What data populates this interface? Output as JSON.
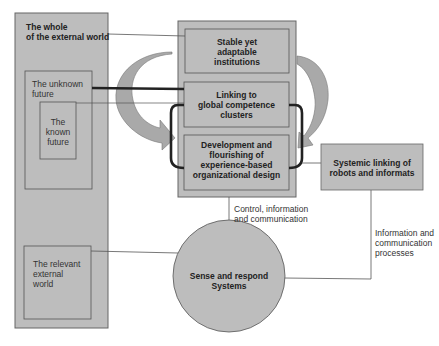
{
  "diagram": {
    "external_world": {
      "label_line1": "The whole",
      "label_line2": "of the external world"
    },
    "unknown_future": {
      "label_line1": "The unknown",
      "label_line2": "future"
    },
    "known_future": {
      "label_line1": "The",
      "label_line2": "known",
      "label_line3": "future"
    },
    "relevant_world": {
      "label_line1": "The relevant",
      "label_line2": "external",
      "label_line3": "world"
    },
    "stable_institutions": {
      "label_line1": "Stable yet",
      "label_line2": "adaptable",
      "label_line3": "institutions"
    },
    "linking_clusters": {
      "label_line1": "Linking to",
      "label_line2": "global competence",
      "label_line3": "clusters"
    },
    "development": {
      "label_line1": "Development and",
      "label_line2": "flourishing of",
      "label_line3": "experience-based",
      "label_line4": "organizational design"
    },
    "robots": {
      "label_line1": "Systemic linking of",
      "label_line2": "robots and informats"
    },
    "sense_respond": {
      "label_line1": "Sense and respond",
      "label_line2": "Systems"
    },
    "control_label": {
      "line1": "Control, information",
      "line2": "and communication"
    },
    "info_label": {
      "line1": "Information and",
      "line2": "communication",
      "line3": "processes"
    },
    "colors": {
      "box_fill": "#bdbdbd",
      "stroke": "#555555",
      "arrow_fill": "#a9a9a9"
    }
  }
}
